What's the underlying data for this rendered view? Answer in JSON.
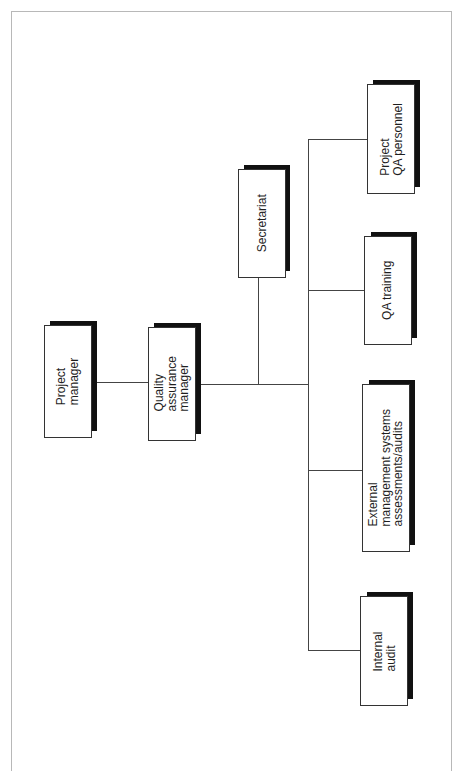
{
  "diagram": {
    "type": "org-chart",
    "orientation": "rotated-90-ccw",
    "nodes": [
      {
        "id": "project_manager",
        "label": "Project\nmanager",
        "box": {
          "x": 44,
          "y": 325,
          "w": 48,
          "h": 113
        }
      },
      {
        "id": "qa_manager",
        "label": "Quality\nassurance\nmanager",
        "box": {
          "x": 148,
          "y": 327,
          "w": 48,
          "h": 114
        }
      },
      {
        "id": "secretariat",
        "label": "Secretariat",
        "box": {
          "x": 238,
          "y": 169,
          "w": 48,
          "h": 109
        }
      },
      {
        "id": "project_qa_personnel",
        "label": "Project\nQA personnel",
        "box": {
          "x": 367,
          "y": 84,
          "w": 48,
          "h": 110
        }
      },
      {
        "id": "qa_training",
        "label": "QA training",
        "box": {
          "x": 364,
          "y": 236,
          "w": 48,
          "h": 109
        }
      },
      {
        "id": "external_assessments",
        "label": "External\nmanagement systems\nassessments/audits",
        "box": {
          "x": 362,
          "y": 384,
          "w": 48,
          "h": 168
        }
      },
      {
        "id": "internal_audit",
        "label": "Internal\naudit",
        "box": {
          "x": 360,
          "y": 596,
          "w": 48,
          "h": 110
        }
      }
    ],
    "edges": [
      {
        "from": "project_manager",
        "to": "qa_manager"
      },
      {
        "from": "qa_manager",
        "to": "secretariat"
      },
      {
        "from": "qa_manager",
        "to": "project_qa_personnel"
      },
      {
        "from": "qa_manager",
        "to": "qa_training"
      },
      {
        "from": "qa_manager",
        "to": "external_assessments"
      },
      {
        "from": "qa_manager",
        "to": "internal_audit"
      }
    ],
    "colors": {
      "line": "#444444",
      "shadow": "#111111",
      "box_border": "#333333",
      "frame": "#b8b8b8"
    }
  }
}
